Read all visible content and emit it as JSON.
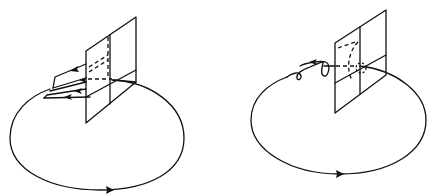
{
  "figure": {
    "caption_fragment": "",
    "panels": [
      {
        "id": "left",
        "description": "Closed elliptical orbit passing through a Poincaré section plane; returning trajectories shown as arrows spreading along a fan near the plane",
        "orbit": {
          "cx": 97,
          "cy": 138,
          "rx": 87,
          "ry": 53,
          "direction": "counterclockwise-front-right",
          "stroke": "#111111"
        },
        "section_plane": {
          "style": "quadrilateral grid with dashed hidden lines"
        },
        "feature": "fan-of-arrows"
      },
      {
        "id": "right",
        "description": "Closed elliptical orbit passing through a Poincaré section plane; trajectory spirals (loops) around the orbit before crossing the plane",
        "orbit": {
          "cx": 338,
          "cy": 120,
          "rx": 88,
          "ry": 55,
          "direction": "counterclockwise-front-right",
          "stroke": "#111111"
        },
        "section_plane": {
          "style": "quadrilateral grid with dashed hidden lines"
        },
        "feature": "spiral-loops"
      }
    ]
  }
}
